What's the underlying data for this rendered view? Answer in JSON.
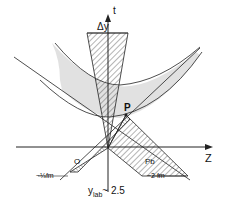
{
  "axes": {
    "t_label": "t",
    "z_label": "Z"
  },
  "labels": {
    "delta_y": "Δy",
    "point_p": "P",
    "nucleus_o": "O",
    "nucleus_pb": "Pb",
    "o_width": "~⅓fm",
    "pb_width": "~2 fm",
    "rapidity": "y",
    "rapidity_sub": "lab",
    "rapidity_value": "~ 2.5"
  },
  "colors": {
    "line": "#222222",
    "shade": "#d9d9d9",
    "background": "#ffffff"
  }
}
